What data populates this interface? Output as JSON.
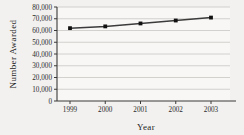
{
  "chart_data": {
    "type": "line",
    "title": "",
    "xlabel": "Year",
    "ylabel": "Number Awarded",
    "categories": [
      "1999",
      "2000",
      "2001",
      "2002",
      "2003"
    ],
    "x": [
      1999,
      2000,
      2001,
      2002,
      2003
    ],
    "values": [
      62000,
      63500,
      66000,
      68500,
      71000
    ],
    "series": [
      {
        "name": "Number Awarded",
        "values": [
          62000,
          63500,
          66000,
          68500,
          71000
        ]
      }
    ],
    "ylim": [
      0,
      80000
    ],
    "yticks": [
      0,
      10000,
      20000,
      30000,
      40000,
      50000,
      60000,
      70000,
      80000
    ],
    "ytick_labels": [
      "0",
      "10,000",
      "20,000",
      "30,000",
      "40,000",
      "50,000",
      "60,000",
      "70,000",
      "80,000"
    ],
    "xticks": [
      1999,
      2000,
      2001,
      2002,
      2003
    ],
    "xtick_labels": [
      "1999",
      "2000",
      "2001",
      "2002",
      "2003"
    ],
    "grid": true,
    "grid_axis": "y",
    "legend": false,
    "legend_position": "none",
    "marker": "square",
    "colors": {
      "background": "#f2f1ef",
      "plot_background": "#f7f6f4",
      "line": "#3c3c3c",
      "marker": "#111111",
      "grid": "#c9c7c4",
      "axis": "#3a3a3a",
      "text": "#1d1d1d"
    }
  },
  "axes": {
    "y_title": "Number Awarded",
    "x_title": "Year"
  }
}
